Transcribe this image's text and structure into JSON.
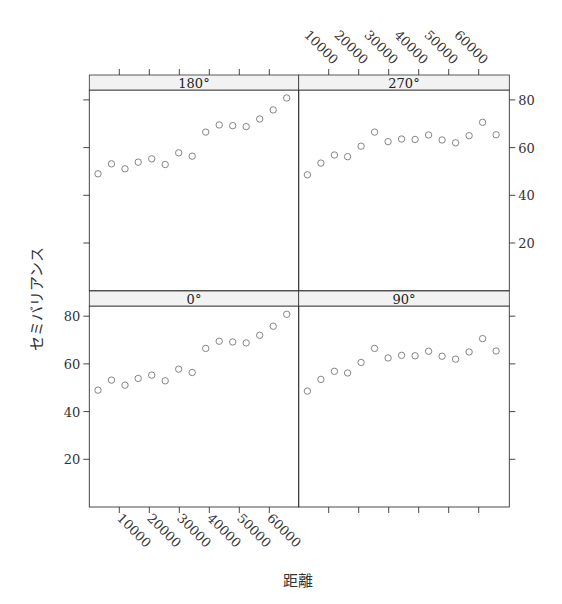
{
  "chart_data": {
    "type": "scatter",
    "title": "",
    "xlabel": "距離",
    "ylabel": "セミバリアンス",
    "layout": "2x2 lattice panels",
    "xlim": [
      0,
      69600
    ],
    "ylim": [
      0,
      83.5
    ],
    "x_ticks": [
      10000,
      20000,
      30000,
      40000,
      50000,
      60000
    ],
    "x_tick_labels": [
      "10000",
      "20000",
      "30000",
      "40000",
      "50000",
      "60000"
    ],
    "y_ticks": [
      20,
      40,
      60,
      80
    ],
    "y_tick_labels": [
      "20",
      "40",
      "60",
      "80"
    ],
    "grid": false,
    "legend": "none",
    "x": [
      2900,
      7400,
      11900,
      16300,
      20800,
      25300,
      29800,
      34300,
      38800,
      43300,
      47800,
      52300,
      56800,
      61300,
      65800
    ],
    "panels": [
      {
        "label": "180°",
        "position": "top-left",
        "values": [
          49.0,
          53.2,
          51.1,
          53.9,
          55.3,
          52.9,
          57.8,
          56.4,
          66.5,
          69.5,
          69.2,
          68.8,
          72.0,
          75.8,
          80.8
        ]
      },
      {
        "label": "270°",
        "position": "top-right",
        "values": [
          48.6,
          53.5,
          56.9,
          56.2,
          60.6,
          66.5,
          62.5,
          63.6,
          63.4,
          65.3,
          63.2,
          62.0,
          65.0,
          70.6,
          65.4
        ]
      },
      {
        "label": "0°",
        "position": "bottom-left",
        "values": [
          49.0,
          53.2,
          51.1,
          53.9,
          55.3,
          52.9,
          57.8,
          56.4,
          66.5,
          69.5,
          69.2,
          68.8,
          72.0,
          75.8,
          80.8
        ]
      },
      {
        "label": "90°",
        "position": "bottom-right",
        "values": [
          48.6,
          53.5,
          56.9,
          56.2,
          60.6,
          66.5,
          62.5,
          63.6,
          63.4,
          65.3,
          63.2,
          62.0,
          65.0,
          70.6,
          65.4
        ]
      }
    ]
  },
  "colors": {
    "points": "#777777",
    "strip_fill": "#f2f2f2",
    "frame": "#333333",
    "text": "#333333"
  }
}
